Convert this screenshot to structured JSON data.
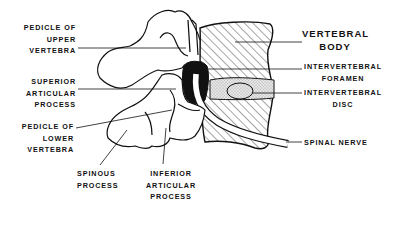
{
  "diagram": {
    "labels": {
      "pedicle_upper": [
        "PEDICLE OF",
        "UPPER",
        "VERTEBRA"
      ],
      "superior_articular": [
        "SUPERIOR",
        "ARTICULAR",
        "PROCESS"
      ],
      "pedicle_lower": [
        "PEDICLE OF",
        "LOWER",
        "VERTEBRA"
      ],
      "spinous": [
        "SPINOUS",
        "PROCESS"
      ],
      "inferior_articular": [
        "INFERIOR",
        "ARTICULAR",
        "PROCESS"
      ],
      "vertebral_body": [
        "VERTEBRAL",
        "BODY"
      ],
      "intervertebral_foramen": [
        "INTERVERTEBRAL",
        "FORAMEN"
      ],
      "intervertebral_disc": [
        "INTERVERTEBRAL",
        "DISC"
      ],
      "spinal_nerve": [
        "SPINAL NERVE"
      ]
    },
    "colors": {
      "ink": "#111111",
      "background": "#ffffff",
      "disc_fill": "#d9d9d9"
    }
  }
}
